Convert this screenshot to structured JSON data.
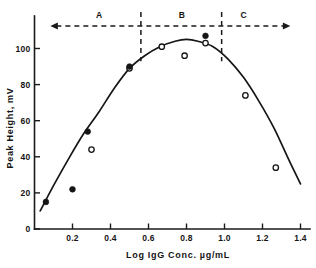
{
  "chart_data": {
    "type": "scatter",
    "title": "",
    "xlabel": "Log  IgG Conc.   µg/mL",
    "ylabel": "Peak  Height,  mV",
    "xlim": [
      0.0,
      1.45
    ],
    "ylim": [
      0,
      118
    ],
    "grid": false,
    "legend_position": "none",
    "xticks": [
      0.2,
      0.4,
      0.6,
      0.8,
      1.0,
      1.2,
      1.4
    ],
    "xticklabels": [
      "0.2",
      "0.4",
      "0.6",
      "0.8",
      "1.0",
      "1.2",
      "1.4"
    ],
    "yticks": [
      0,
      20,
      40,
      60,
      80,
      100
    ],
    "yticklabels": [
      "0",
      "20",
      "40",
      "60",
      "80",
      "100"
    ],
    "series": [
      {
        "name": "filled-markers",
        "marker": "filled-circle",
        "x": [
          0.06,
          0.2,
          0.28,
          0.5,
          0.9
        ],
        "y": [
          15,
          22,
          54,
          90,
          107
        ]
      },
      {
        "name": "open-markers",
        "marker": "open-circle",
        "x": [
          0.3,
          0.5,
          0.67,
          0.79,
          0.9,
          1.11,
          1.27
        ],
        "y": [
          44,
          89,
          101,
          96,
          103,
          74,
          34
        ]
      }
    ],
    "fit_curve": {
      "name": "fitted-response-curve",
      "x": [
        0.03,
        0.1,
        0.18,
        0.26,
        0.34,
        0.42,
        0.5,
        0.58,
        0.66,
        0.74,
        0.8,
        0.86,
        0.94,
        1.02,
        1.1,
        1.18,
        1.26,
        1.34,
        1.4
      ],
      "y": [
        10,
        24,
        39,
        53,
        65,
        78,
        89,
        96,
        101,
        104,
        105,
        104,
        101,
        94,
        84,
        71,
        56,
        38,
        25
      ]
    },
    "annotations": {
      "regions": [
        {
          "label": "A",
          "center": 0.34,
          "range": [
            0.12,
            0.56
          ]
        },
        {
          "label": "B",
          "center": 0.775,
          "range": [
            0.56,
            0.985
          ]
        },
        {
          "label": "C",
          "center": 1.1,
          "range": [
            0.985,
            1.3
          ]
        }
      ],
      "dividers": [
        0.56,
        0.985
      ],
      "span_arrow": {
        "from": 0.115,
        "to": 1.315,
        "double_headed": true
      }
    }
  },
  "colors": {
    "ink": "#151515",
    "background": "#ffffff"
  }
}
